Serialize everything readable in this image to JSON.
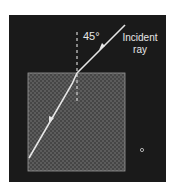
{
  "diagram": {
    "background_color": "#ffffff",
    "panel_color": "#1a1a1a",
    "medium_color": "#5a5a5a",
    "ray_color": "#e6e6e6",
    "labels": {
      "angle": "45°",
      "incident_line1": "Incident",
      "incident_line2": "ray"
    },
    "elements": {
      "panel": {
        "x": 9,
        "y": 15,
        "width": 157,
        "height": 167
      },
      "medium_block": {
        "x": 28,
        "y": 73,
        "width": 97,
        "height": 98
      },
      "normal_line": {
        "x": 77,
        "y1": 32,
        "y2": 104,
        "style": "dashed"
      },
      "incident_ray": {
        "from": [
          125,
          25
        ],
        "to": [
          77,
          73
        ]
      },
      "refracted_ray": {
        "from": [
          77,
          73
        ],
        "to": [
          29,
          158
        ]
      },
      "dot": {
        "x": 142,
        "y": 150
      }
    }
  }
}
